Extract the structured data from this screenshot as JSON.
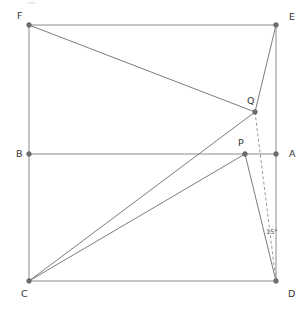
{
  "figure": {
    "type": "geometry-diagram",
    "width": 306,
    "height": 310,
    "background_color": "#ffffff",
    "line_color": "#8a8a8a",
    "dashed_line_color": "#9a9a9a",
    "vertex_color": "#6e6e6e",
    "label_color": "#333333"
  },
  "points": [
    {
      "id": "F",
      "label": "F",
      "x": 29,
      "y": 25,
      "label_x": 17,
      "label_y": 16
    },
    {
      "id": "E",
      "label": "E",
      "x": 276,
      "y": 25,
      "label_x": 289,
      "label_y": 17
    },
    {
      "id": "B",
      "label": "B",
      "x": 29,
      "y": 154,
      "label_x": 16,
      "label_y": 154
    },
    {
      "id": "A",
      "label": "A",
      "x": 276,
      "y": 154,
      "label_x": 289,
      "label_y": 154
    },
    {
      "id": "C",
      "label": "C",
      "x": 29,
      "y": 281,
      "label_x": 21,
      "label_y": 294
    },
    {
      "id": "D",
      "label": "D",
      "x": 276,
      "y": 281,
      "label_x": 288,
      "label_y": 294
    },
    {
      "id": "Q",
      "label": "Q",
      "x": 255,
      "y": 112,
      "label_x": 247,
      "label_y": 101
    },
    {
      "id": "P",
      "label": "P",
      "x": 245,
      "y": 154,
      "label_x": 238,
      "label_y": 143
    }
  ],
  "segments": [
    {
      "id": "FE",
      "from": "F",
      "to": "E",
      "style": "solid",
      "kind": "rectangle-edge"
    },
    {
      "id": "ED",
      "from": "E",
      "to": "D",
      "style": "solid",
      "kind": "rectangle-edge"
    },
    {
      "id": "DC",
      "from": "D",
      "to": "C",
      "style": "solid",
      "kind": "rectangle-edge"
    },
    {
      "id": "CF",
      "from": "C",
      "to": "F",
      "style": "solid",
      "kind": "rectangle-edge"
    },
    {
      "id": "BA",
      "from": "B",
      "to": "A",
      "style": "solid",
      "kind": "midline"
    },
    {
      "id": "FQ",
      "from": "F",
      "to": "Q",
      "style": "solid",
      "kind": "construction"
    },
    {
      "id": "EQ",
      "from": "E",
      "to": "Q",
      "style": "solid",
      "kind": "construction"
    },
    {
      "id": "CQ",
      "from": "C",
      "to": "Q",
      "style": "solid",
      "kind": "construction"
    },
    {
      "id": "CP",
      "from": "C",
      "to": "P",
      "style": "solid",
      "kind": "construction"
    },
    {
      "id": "PD",
      "from": "P",
      "to": "D",
      "style": "solid",
      "kind": "construction"
    },
    {
      "id": "QD",
      "from": "Q",
      "to": "D",
      "style": "dashed",
      "kind": "construction"
    }
  ],
  "annotations": [
    {
      "id": "angle-15",
      "text": "15°",
      "x": 266,
      "y": 232,
      "between": [
        "PD",
        "QD"
      ],
      "vertex": "D"
    }
  ]
}
